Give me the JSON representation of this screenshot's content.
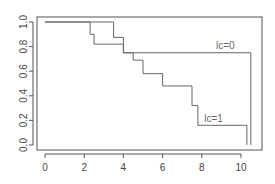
{
  "chart_data": {
    "type": "line",
    "subtype": "step (Kaplan-Meier survival curves)",
    "title": "",
    "xlabel": "",
    "ylabel": "",
    "xlim": [
      0,
      10.5
    ],
    "ylim": [
      0,
      1.0
    ],
    "x_ticks": [
      0,
      2,
      4,
      6,
      8,
      10
    ],
    "x_tick_labels": [
      "0",
      "2",
      "4",
      "6",
      "8",
      "10"
    ],
    "y_ticks": [
      0.0,
      0.2,
      0.4,
      0.6,
      0.8,
      1.0
    ],
    "y_tick_labels": [
      "0.0",
      "0.2",
      "0.4",
      "0.6",
      "0.8",
      "1.0"
    ],
    "grid": false,
    "legend": null,
    "series": [
      {
        "name": "lc=0",
        "label": "lc=0",
        "color": "#666666",
        "steps": [
          {
            "x": 0.0,
            "y": 1.0
          },
          {
            "x": 3.5,
            "y": 0.875
          },
          {
            "x": 4.0,
            "y": 0.75
          },
          {
            "x": 10.5,
            "y": 0.0
          }
        ]
      },
      {
        "name": "lc=1",
        "label": "lc=1",
        "color": "#666666",
        "steps": [
          {
            "x": 0.0,
            "y": 1.0
          },
          {
            "x": 2.3,
            "y": 0.9
          },
          {
            "x": 2.5,
            "y": 0.82
          },
          {
            "x": 4.0,
            "y": 0.75
          },
          {
            "x": 4.5,
            "y": 0.69
          },
          {
            "x": 5.0,
            "y": 0.58
          },
          {
            "x": 6.0,
            "y": 0.48
          },
          {
            "x": 7.5,
            "y": 0.32
          },
          {
            "x": 7.8,
            "y": 0.16
          },
          {
            "x": 10.3,
            "y": 0.0
          }
        ]
      }
    ],
    "annotations": [
      {
        "text": "lc=0",
        "x": 9.2,
        "y": 0.78
      },
      {
        "text": "lc=1",
        "x": 8.6,
        "y": 0.19
      }
    ]
  }
}
